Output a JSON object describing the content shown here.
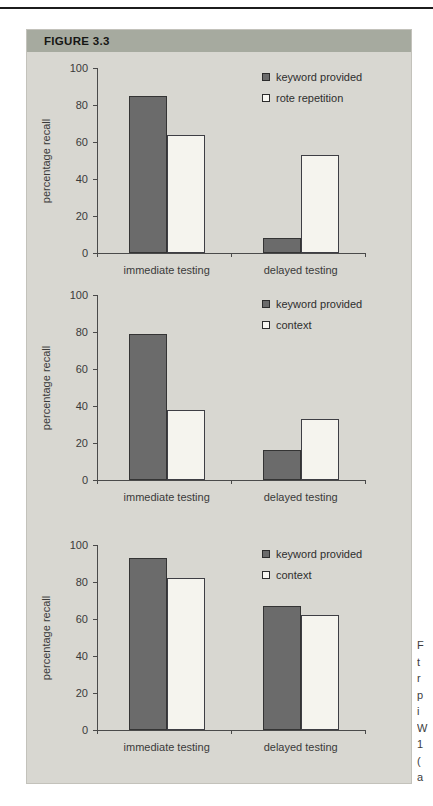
{
  "figure": {
    "label": "FIGURE 3.3"
  },
  "colors": {
    "panel_bg": "#d8d7d1",
    "header_bg": "#a6aa9f",
    "top_rule": "#1c1c1c",
    "series_dark_fill": "#6b6b6b",
    "series_dark_border": "#343434",
    "series_light_fill": "#f5f4ee",
    "series_light_border": "#3e3e44",
    "axis": "#4a4a4a",
    "text": "#3a3a3a"
  },
  "caption_fragments": [
    "F",
    "t",
    "r",
    "p",
    "i",
    "W",
    "1",
    "(",
    "a"
  ],
  "chart_data": [
    {
      "type": "bar",
      "title": "",
      "categories": [
        "immediate testing",
        "delayed testing"
      ],
      "series": [
        {
          "name": "keyword provided",
          "style": "dark",
          "values": [
            85,
            8
          ]
        },
        {
          "name": "rote repetition",
          "style": "light",
          "values": [
            64,
            53
          ]
        }
      ],
      "xlabel": "",
      "ylabel": "percentage recall",
      "ylim": [
        0,
        100
      ],
      "yticks": [
        0,
        20,
        40,
        60,
        80,
        100
      ],
      "grid": false,
      "legend_position": "top-right"
    },
    {
      "type": "bar",
      "title": "",
      "categories": [
        "immediate testing",
        "delayed testing"
      ],
      "series": [
        {
          "name": "keyword provided",
          "style": "dark",
          "values": [
            79,
            16
          ]
        },
        {
          "name": "context",
          "style": "light",
          "values": [
            38,
            33
          ]
        }
      ],
      "xlabel": "",
      "ylabel": "percentage recall",
      "ylim": [
        0,
        100
      ],
      "yticks": [
        0,
        20,
        40,
        60,
        80,
        100
      ],
      "grid": false,
      "legend_position": "top-right"
    },
    {
      "type": "bar",
      "title": "",
      "categories": [
        "immediate testing",
        "delayed testing"
      ],
      "series": [
        {
          "name": "keyword provided",
          "style": "dark",
          "values": [
            93,
            67
          ]
        },
        {
          "name": "context",
          "style": "light",
          "values": [
            82,
            62
          ]
        }
      ],
      "xlabel": "",
      "ylabel": "percentage recall",
      "ylim": [
        0,
        100
      ],
      "yticks": [
        0,
        20,
        40,
        60,
        80,
        100
      ],
      "grid": false,
      "legend_position": "top-right"
    }
  ]
}
